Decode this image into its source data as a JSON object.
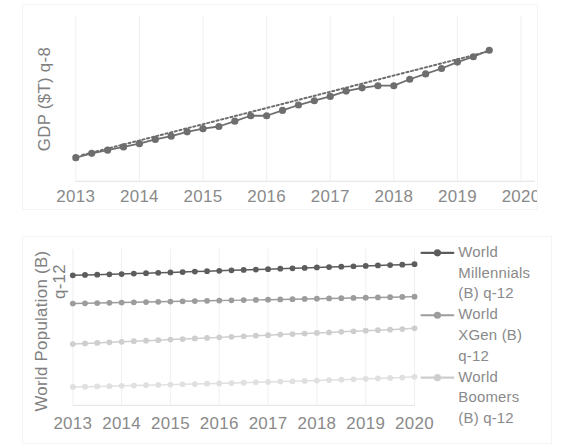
{
  "page": {
    "background": "#ffffff",
    "width": 563,
    "height": 448
  },
  "chart_data": [
    {
      "id": "gdp-chart",
      "type": "line",
      "title": "",
      "xlabel": "",
      "ylabel": "GDP ($T) q-8",
      "xtick_labels": [
        "2013",
        "2014",
        "2015",
        "2016",
        "2017",
        "2018",
        "2019",
        "2020"
      ],
      "xlim": [
        2013,
        2020
      ],
      "ylim": [
        14.5,
        22.2
      ],
      "grid": "vertical",
      "legend": "none",
      "series": [
        {
          "name": "GDP ($T) q-8",
          "color": "#6e6e6e",
          "marker": "circle",
          "x": [
            2013.0,
            2013.25,
            2013.5,
            2013.75,
            2014.0,
            2014.25,
            2014.5,
            2014.75,
            2015.0,
            2015.25,
            2015.5,
            2015.75,
            2016.0,
            2016.25,
            2016.5,
            2016.75,
            2017.0,
            2017.25,
            2017.5,
            2017.75,
            2018.0,
            2018.25,
            2018.5,
            2018.75,
            2019.0,
            2019.25,
            2019.5
          ],
          "values": [
            15.6,
            15.8,
            15.95,
            16.1,
            16.25,
            16.45,
            16.6,
            16.8,
            16.95,
            17.05,
            17.3,
            17.55,
            17.55,
            17.8,
            18.05,
            18.25,
            18.45,
            18.7,
            18.85,
            18.95,
            18.95,
            19.25,
            19.5,
            19.75,
            20.05,
            20.3,
            20.6
          ]
        }
      ],
      "trendline": {
        "name": "linear-trend",
        "color": "#6e6e6e",
        "style": "dotted",
        "x": [
          2013.1,
          2019.45
        ],
        "values": [
          15.72,
          20.52
        ]
      }
    },
    {
      "id": "population-chart",
      "type": "line",
      "title": "",
      "xlabel": "",
      "ylabel": "World Population (B) q-12",
      "xtick_labels": [
        "2013",
        "2014",
        "2015",
        "2016",
        "2017",
        "2018",
        "2019",
        "2020"
      ],
      "xlim": [
        2013,
        2020
      ],
      "ylim": [
        0,
        2.55
      ],
      "grid": "vertical",
      "legend": "right",
      "series": [
        {
          "name": "World Millennials (B) q-12",
          "color": "#5c5c5c",
          "marker": "circle",
          "x": [
            2013.0,
            2013.25,
            2013.5,
            2013.75,
            2014.0,
            2014.25,
            2014.5,
            2014.75,
            2015.0,
            2015.25,
            2015.5,
            2015.75,
            2016.0,
            2016.25,
            2016.5,
            2016.75,
            2017.0,
            2017.25,
            2017.5,
            2017.75,
            2018.0,
            2018.25,
            2018.5,
            2018.75,
            2019.0,
            2019.25,
            2019.5,
            2019.75,
            2020.0
          ],
          "values": [
            2.12,
            2.125,
            2.13,
            2.135,
            2.14,
            2.147,
            2.153,
            2.16,
            2.167,
            2.173,
            2.18,
            2.187,
            2.193,
            2.2,
            2.207,
            2.213,
            2.22,
            2.227,
            2.233,
            2.24,
            2.247,
            2.253,
            2.26,
            2.267,
            2.273,
            2.28,
            2.287,
            2.293,
            2.3
          ]
        },
        {
          "name": "World XGen (B) q-12",
          "color": "#9c9c9c",
          "marker": "circle",
          "x": [
            2013.0,
            2013.25,
            2013.5,
            2013.75,
            2014.0,
            2014.25,
            2014.5,
            2014.75,
            2015.0,
            2015.25,
            2015.5,
            2015.75,
            2016.0,
            2016.25,
            2016.5,
            2016.75,
            2017.0,
            2017.25,
            2017.5,
            2017.75,
            2018.0,
            2018.25,
            2018.5,
            2018.75,
            2019.0,
            2019.25,
            2019.5,
            2019.75,
            2020.0
          ],
          "values": [
            1.66,
            1.663,
            1.667,
            1.671,
            1.675,
            1.679,
            1.683,
            1.687,
            1.691,
            1.695,
            1.699,
            1.703,
            1.707,
            1.711,
            1.715,
            1.719,
            1.723,
            1.727,
            1.731,
            1.735,
            1.739,
            1.743,
            1.747,
            1.751,
            1.755,
            1.759,
            1.763,
            1.767,
            1.772
          ]
        },
        {
          "name": "World Boomers (B) q-12",
          "color": "#cecece",
          "marker": "circle",
          "x": [
            2013.0,
            2013.25,
            2013.5,
            2013.75,
            2014.0,
            2014.25,
            2014.5,
            2014.75,
            2015.0,
            2015.25,
            2015.5,
            2015.75,
            2016.0,
            2016.25,
            2016.5,
            2016.75,
            2017.0,
            2017.25,
            2017.5,
            2017.75,
            2018.0,
            2018.25,
            2018.5,
            2018.75,
            2019.0,
            2019.25,
            2019.5,
            2019.75,
            2020.0
          ],
          "values": [
            1.0,
            1.009,
            1.018,
            1.027,
            1.036,
            1.045,
            1.054,
            1.063,
            1.072,
            1.081,
            1.09,
            1.099,
            1.108,
            1.117,
            1.126,
            1.135,
            1.144,
            1.153,
            1.162,
            1.171,
            1.18,
            1.189,
            1.198,
            1.207,
            1.216,
            1.225,
            1.234,
            1.243,
            1.255
          ]
        },
        {
          "name": "series-4",
          "color": "#e0e0e0",
          "marker": "circle",
          "x": [
            2013.0,
            2013.25,
            2013.5,
            2013.75,
            2014.0,
            2014.25,
            2014.5,
            2014.75,
            2015.0,
            2015.25,
            2015.5,
            2015.75,
            2016.0,
            2016.25,
            2016.5,
            2016.75,
            2017.0,
            2017.25,
            2017.5,
            2017.75,
            2018.0,
            2018.25,
            2018.5,
            2018.75,
            2019.0,
            2019.25,
            2019.5,
            2019.75,
            2020.0
          ],
          "values": [
            0.3,
            0.304,
            0.309,
            0.313,
            0.318,
            0.323,
            0.328,
            0.333,
            0.338,
            0.343,
            0.348,
            0.353,
            0.358,
            0.364,
            0.369,
            0.375,
            0.381,
            0.387,
            0.393,
            0.399,
            0.405,
            0.412,
            0.418,
            0.425,
            0.432,
            0.439,
            0.446,
            0.453,
            0.465
          ]
        }
      ],
      "legend_entries": [
        {
          "label": "World Millennials (B) q-12",
          "color": "#5c5c5c"
        },
        {
          "label": "World XGen (B) q-12",
          "color": "#9c9c9c"
        },
        {
          "label": "World Boomers (B) q-12",
          "color": "#cecece"
        }
      ]
    }
  ],
  "top_chart": {
    "ylabel": "GDP ($T) q-8",
    "xticks": [
      "2013",
      "2014",
      "2015",
      "2016",
      "2017",
      "2018",
      "2019",
      "2020"
    ]
  },
  "bottom_chart": {
    "ylabel_line1": "World Population (B)",
    "ylabel_line2": "q-12",
    "xticks": [
      "2013",
      "2014",
      "2015",
      "2016",
      "2017",
      "2018",
      "2019",
      "2020"
    ],
    "legend": [
      {
        "line1": "World",
        "line2": "Millennials",
        "line3": "(B) q-12",
        "color": "#5c5c5c"
      },
      {
        "line1": "World",
        "line2": "XGen (B)",
        "line3": "q-12",
        "color": "#9c9c9c"
      },
      {
        "line1": "World",
        "line2": "Boomers",
        "line3": "(B) q-12",
        "color": "#cecece"
      }
    ]
  },
  "colors": {
    "grid": "#f0f0f0",
    "axis": "#e2e2e2",
    "text": "#8a8a8a",
    "series_dark": "#6e6e6e",
    "panel_border": "#f4f4f4"
  }
}
